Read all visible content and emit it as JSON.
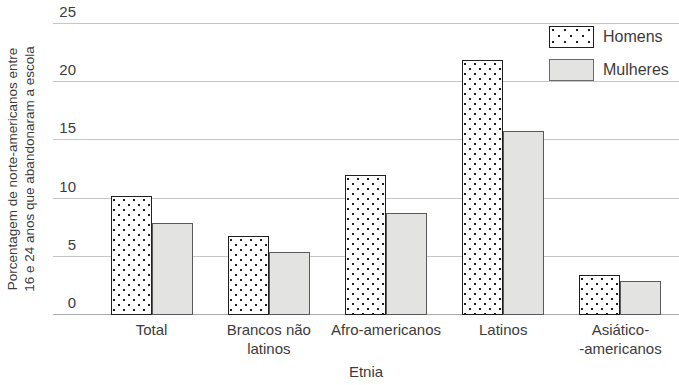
{
  "chart_data": {
    "type": "bar",
    "title": "",
    "xlabel": "Etnia",
    "ylabel_lines": [
      "Porcentagem de norte-americanos entre",
      "16 e 24 anos que abandonaram a escola"
    ],
    "categories": [
      "Total",
      "Brancos não\nlatinos",
      "Afro-americanos",
      "Latinos",
      "Asiático-\n-americanos"
    ],
    "series": [
      {
        "name": "Homens",
        "style": "dotted-white",
        "values": [
          10.2,
          6.8,
          12.0,
          21.9,
          3.4
        ]
      },
      {
        "name": "Mulheres",
        "style": "solid-gray",
        "values": [
          7.9,
          5.4,
          8.8,
          15.8,
          2.9
        ]
      }
    ],
    "y_ticks": [
      0,
      5,
      10,
      15,
      20,
      25
    ],
    "ylim": [
      0,
      25
    ],
    "grid": true,
    "legend_position": "top-right",
    "colors": {
      "homens_fill": "#ffffff",
      "homens_dot": "#1f1f1f",
      "homens_border": "#1f1f1f",
      "mulheres_fill": "#e3e3e1",
      "mulheres_border": "#5a5a5a",
      "gridline": "#c6c6c6",
      "baseline": "#a9a9a9",
      "text": "#3c3c3c"
    }
  }
}
